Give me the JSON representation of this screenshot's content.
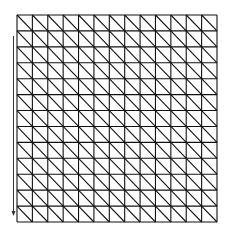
{
  "diagram": {
    "type": "triangulated-grid",
    "rows": 13,
    "cols": 13,
    "grid_box": {
      "x": 17,
      "y": 15,
      "width": 200,
      "height": 207
    },
    "diagonal_direction": "top-left-to-bottom-right",
    "line_color": "#111111",
    "background_color": "#ffffff",
    "arrow": {
      "x": 13.5,
      "y_start": 36,
      "y_end": 216,
      "direction": "down",
      "color": "#333333"
    }
  }
}
